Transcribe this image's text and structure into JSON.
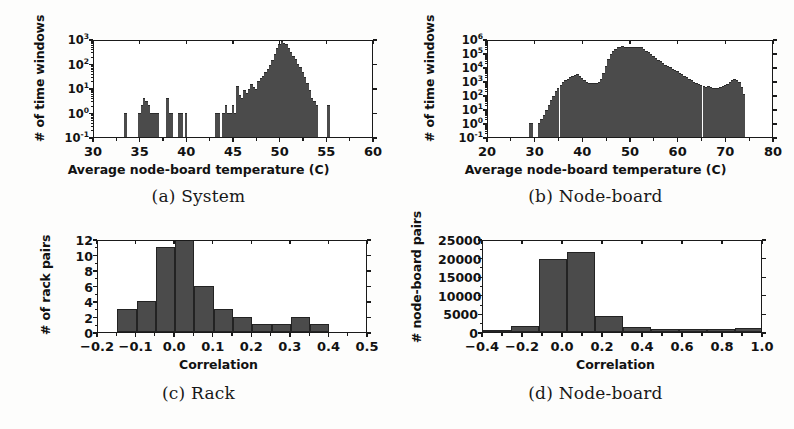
{
  "figure": {
    "panels": [
      {
        "id": "a",
        "caption": "(a) System",
        "ylabel": "# of time windows",
        "xlabel": "Average node-board temperature (C)"
      },
      {
        "id": "b",
        "caption": "(b) Node-board",
        "ylabel": "# of time windows",
        "xlabel": "Average node-board temperature (C)"
      },
      {
        "id": "c",
        "caption": "(c) Rack",
        "ylabel": "# of rack pairs",
        "xlabel": "Correlation"
      },
      {
        "id": "d",
        "caption": "(d) Node-board",
        "ylabel": "# node-board pairs",
        "xlabel": "Correlation"
      }
    ]
  },
  "colors": {
    "bar_fill": "#4b4b4b",
    "axis": "#1a1a1a",
    "page_background": "#fdfdfc",
    "plot_background": "#ffffff"
  },
  "chart_data": [
    {
      "type": "bar",
      "panel": "a",
      "title": "(a) System",
      "xlabel": "Average node-board temperature (C)",
      "ylabel": "# of time windows",
      "xlim": [
        30,
        60
      ],
      "ylim": [
        0.1,
        1000
      ],
      "yscale": "log",
      "grid": false,
      "legend": null,
      "xticks": [
        30,
        35,
        40,
        45,
        50,
        55,
        60
      ],
      "xticklabels": [
        "30",
        "35",
        "40",
        "45",
        "50",
        "55",
        "60"
      ],
      "yticks": [
        0.1,
        1,
        10,
        100,
        1000
      ],
      "yticklabels": [
        "10-1",
        "10 0",
        "10 1",
        "10 2",
        "10 3"
      ],
      "yticklabels_mantissa": [
        "10",
        "10",
        "10",
        "10",
        "10"
      ],
      "yticklabels_exponent": [
        "-1",
        "0",
        "1",
        "2",
        "3"
      ],
      "bin_width": 0.25,
      "bin_starts": [
        33.25,
        34.75,
        35.0,
        35.25,
        35.5,
        35.75,
        36.0,
        36.25,
        36.5,
        36.75,
        37.75,
        38.0,
        38.25,
        39.0,
        39.25,
        39.75,
        43.0,
        43.25,
        43.75,
        44.0,
        44.25,
        44.5,
        44.75,
        45.0,
        45.25,
        45.5,
        45.75,
        46.0,
        46.25,
        46.5,
        46.75,
        47.0,
        47.25,
        47.5,
        47.75,
        48.0,
        48.25,
        48.5,
        48.75,
        49.0,
        49.25,
        49.5,
        49.75,
        50.0,
        50.25,
        50.5,
        50.75,
        51.0,
        51.25,
        51.5,
        51.75,
        52.0,
        52.25,
        52.5,
        52.75,
        53.0,
        53.25,
        53.5,
        53.75,
        55.0
      ],
      "values": [
        1,
        1,
        2,
        4,
        3,
        2,
        1,
        1,
        1,
        1,
        4,
        1,
        1,
        1,
        1,
        1,
        1,
        1,
        1,
        2,
        1,
        1,
        2,
        1,
        12,
        5,
        4,
        8,
        6,
        9,
        14,
        11,
        9,
        20,
        25,
        30,
        45,
        60,
        90,
        140,
        250,
        420,
        650,
        800,
        700,
        600,
        420,
        300,
        210,
        150,
        100,
        70,
        45,
        28,
        16,
        8,
        4,
        3,
        2,
        2
      ]
    },
    {
      "type": "area",
      "panel": "b",
      "title": "(b) Node-board",
      "xlabel": "Average node-board temperature (C)",
      "ylabel": "# of time windows",
      "xlim": [
        20,
        80
      ],
      "ylim": [
        0.1,
        1000000
      ],
      "yscale": "log",
      "grid": false,
      "legend": null,
      "xticks": [
        20,
        30,
        40,
        50,
        60,
        70,
        80
      ],
      "xticklabels": [
        "20",
        "30",
        "40",
        "50",
        "60",
        "70",
        "80"
      ],
      "yticks": [
        0.1,
        1,
        10,
        100,
        1000,
        10000,
        100000,
        1000000
      ],
      "yticklabels_mantissa": [
        "10",
        "10",
        "10",
        "10",
        "10",
        "10",
        "10",
        "10"
      ],
      "yticklabels_exponent": [
        "-1",
        "0",
        "1",
        "2",
        "3",
        "4",
        "5",
        "6"
      ],
      "bin_width": 0.5,
      "bin_starts": [
        28.5,
        29.0,
        30.5,
        31.0,
        31.5,
        32.0,
        32.5,
        33.0,
        33.5,
        34.0,
        34.5,
        35.0,
        35.5,
        36.0,
        36.5,
        37.0,
        37.5,
        38.0,
        38.5,
        39.0,
        39.5,
        40.0,
        40.5,
        41.0,
        41.5,
        42.0,
        42.5,
        43.0,
        43.5,
        44.0,
        44.5,
        45.0,
        45.5,
        46.0,
        46.5,
        47.0,
        47.5,
        48.0,
        48.5,
        49.0,
        49.5,
        50.0,
        50.5,
        51.0,
        51.5,
        52.0,
        52.5,
        53.0,
        53.5,
        54.0,
        54.5,
        55.0,
        55.5,
        56.0,
        56.5,
        57.0,
        57.5,
        58.0,
        58.5,
        59.0,
        59.5,
        60.0,
        60.5,
        61.0,
        61.5,
        62.0,
        62.5,
        63.0,
        63.5,
        64.0,
        64.5,
        65.0,
        65.5,
        66.0,
        66.5,
        67.0,
        67.5,
        68.0,
        68.5,
        69.0,
        69.5,
        70.0,
        70.5,
        71.0,
        71.5,
        72.0,
        72.5,
        73.0,
        73.5
      ],
      "values": [
        1,
        1,
        1,
        2,
        4,
        9,
        20,
        45,
        90,
        180,
        320,
        550,
        800,
        1100,
        1500,
        1900,
        2300,
        2700,
        3000,
        2400,
        1700,
        1200,
        900,
        750,
        700,
        680,
        700,
        800,
        1500,
        4000,
        12000,
        35000,
        80000,
        140000,
        200000,
        250000,
        280000,
        300000,
        290000,
        270000,
        260000,
        270000,
        280000,
        285000,
        280000,
        250000,
        200000,
        150000,
        110000,
        80000,
        60000,
        45000,
        33000,
        25000,
        19000,
        15000,
        12000,
        9500,
        7500,
        6000,
        4800,
        3800,
        3000,
        2300,
        1800,
        1400,
        1100,
        850,
        700,
        580,
        480,
        420,
        400,
        450,
        380,
        330,
        300,
        320,
        380,
        430,
        500,
        620,
        800,
        1100,
        1400,
        1200,
        800,
        400,
        120,
        20
      ]
    },
    {
      "type": "bar",
      "panel": "c",
      "title": "(c) Rack",
      "xlabel": "Correlation",
      "ylabel": "# of rack pairs",
      "xlim": [
        -0.2,
        0.5
      ],
      "ylim": [
        0,
        12
      ],
      "yscale": "linear",
      "grid": false,
      "legend": null,
      "xticks": [
        -0.2,
        -0.1,
        0.0,
        0.1,
        0.2,
        0.3,
        0.4,
        0.5
      ],
      "xticklabels": [
        "−0.2",
        "−0.1",
        "0.0",
        "0.1",
        "0.2",
        "0.3",
        "0.4",
        "0.5"
      ],
      "yticks": [
        0,
        2,
        4,
        6,
        8,
        10,
        12
      ],
      "yticklabels": [
        "0",
        "2",
        "4",
        "6",
        "8",
        "10",
        "12"
      ],
      "bin_width": 0.05,
      "bin_starts": [
        -0.15,
        -0.1,
        -0.05,
        0.0,
        0.05,
        0.1,
        0.15,
        0.2,
        0.25,
        0.3,
        0.35
      ],
      "values": [
        3,
        4,
        11,
        12,
        6,
        3,
        2,
        1,
        1,
        2,
        1
      ]
    },
    {
      "type": "bar",
      "panel": "d",
      "title": "(d) Node-board",
      "xlabel": "Correlation",
      "ylabel": "# node-board pairs",
      "xlim": [
        -0.4,
        1.0
      ],
      "ylim": [
        0,
        25000
      ],
      "yscale": "linear",
      "grid": false,
      "legend": null,
      "xticks": [
        -0.4,
        -0.2,
        0.0,
        0.2,
        0.4,
        0.6,
        0.8,
        1.0
      ],
      "xticklabels": [
        "−0.4",
        "−0.2",
        "0.0",
        "0.2",
        "0.4",
        "0.6",
        "0.8",
        "1.0"
      ],
      "yticks": [
        0,
        5000,
        10000,
        15000,
        20000,
        25000
      ],
      "yticklabels": [
        "0",
        "5000",
        "10000",
        "15000",
        "20000",
        "25000"
      ],
      "bin_width": 0.14,
      "bin_starts": [
        -0.4,
        -0.26,
        -0.12,
        0.02,
        0.16,
        0.3,
        0.44,
        0.58,
        0.72,
        0.86
      ],
      "values": [
        150,
        1500,
        19700,
        21400,
        4200,
        1400,
        900,
        800,
        750,
        1000
      ]
    }
  ]
}
